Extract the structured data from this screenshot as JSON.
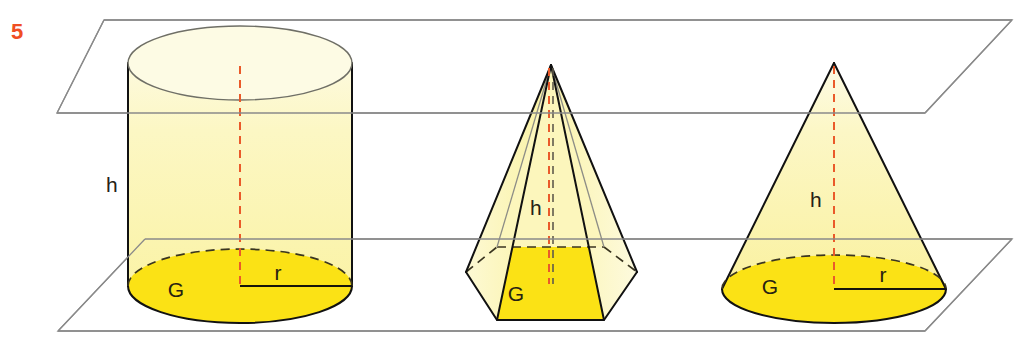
{
  "figure": {
    "exercise_number": "5",
    "exercise_number_color": "#f04e23",
    "caption_visible": false,
    "background_color": "#ffffff",
    "canvas": {
      "width": 1032,
      "height": 347
    }
  },
  "palette": {
    "body_fill": "#faf4a6",
    "body_fill_light": "#fcfadd",
    "base_fill": "#fbe215",
    "outline_dark": "#111111",
    "outline_faint": "#8d8d86",
    "plane_stroke": "#8a8a8a",
    "axis_dash": "#ea5a2a",
    "hidden_dash": "#3a3520",
    "label_text": "#262112"
  },
  "planes": {
    "upper": {
      "name": "upper-parallel-plane",
      "points": "104,20 1012,20 925,113 57,113"
    },
    "lower": {
      "name": "lower-parallel-plane",
      "points": "145,239 1012,239 925,331 58,331"
    }
  },
  "solids": [
    {
      "id": "cylinder",
      "name": "cylinder",
      "label": "Zylinder",
      "center_x": 240,
      "top_ellipse": {
        "cx": 240,
        "cy": 63,
        "rx": 112,
        "ry": 37
      },
      "bottom_ellipse": {
        "cx": 240,
        "cy": 286,
        "rx": 112,
        "ry": 37
      },
      "labels": {
        "height": {
          "text": "h",
          "x": 112,
          "y": 192
        },
        "base": {
          "text": "G",
          "x": 176,
          "y": 297
        },
        "radius": {
          "text": "r",
          "x": 276,
          "y": 280
        }
      }
    },
    {
      "id": "pyramid",
      "name": "hexagonal-pyramid",
      "label": "Pyramide",
      "apex": {
        "x": 551,
        "y": 65
      },
      "base_polygon": "466,272 497,320 604,320 637,272 604,247 497,247",
      "labels": {
        "height": {
          "text": "h",
          "x": 536,
          "y": 215
        },
        "base": {
          "text": "G",
          "x": 514,
          "y": 300
        }
      }
    },
    {
      "id": "cone",
      "name": "cone",
      "label": "Kegel",
      "apex": {
        "x": 834,
        "y": 63
      },
      "base_ellipse": {
        "cx": 834,
        "cy": 289,
        "rx": 112,
        "ry": 34
      },
      "labels": {
        "height": {
          "text": "h",
          "x": 816,
          "y": 207
        },
        "base": {
          "text": "G",
          "x": 770,
          "y": 293
        },
        "radius": {
          "text": "r",
          "x": 881,
          "y": 282
        }
      }
    }
  ]
}
